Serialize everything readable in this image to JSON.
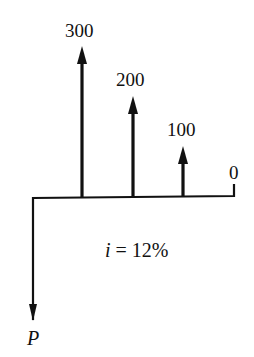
{
  "diagram": {
    "type": "cash-flow-diagram",
    "interest_rate_label": "i = 12%",
    "interest_variable": "i",
    "interest_value": "= 12%",
    "present_value_label": "P",
    "cash_flows": [
      {
        "period": 1,
        "amount": 300,
        "label": "300",
        "direction": "up"
      },
      {
        "period": 2,
        "amount": 200,
        "label": "200",
        "direction": "up"
      },
      {
        "period": 3,
        "amount": 100,
        "label": "100",
        "direction": "up"
      },
      {
        "period": 4,
        "amount": 0,
        "label": "0",
        "direction": "none"
      }
    ],
    "present_value": {
      "period": 0,
      "label": "P",
      "direction": "down"
    },
    "colors": {
      "ink": "#111111",
      "background": "#ffffff"
    }
  }
}
